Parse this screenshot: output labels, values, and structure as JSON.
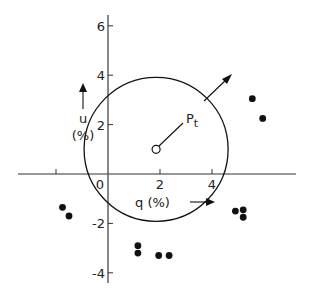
{
  "diagram": {
    "type": "scatter-with-circle",
    "center_label": "P_t",
    "center_label_main": "P",
    "center_label_sub": "t",
    "x_axis": {
      "label": "q (%)",
      "ticks": [
        {
          "value": 0,
          "label": "0"
        },
        {
          "value": 2,
          "label": "2"
        },
        {
          "value": 4,
          "label": "4"
        }
      ],
      "minor_ticks": [
        -2
      ]
    },
    "y_axis": {
      "label_top": "u",
      "label_bottom": "(%)",
      "ticks": [
        {
          "value": 6,
          "label": "6"
        },
        {
          "value": 4,
          "label": "4"
        },
        {
          "value": 2,
          "label": "2"
        },
        {
          "value": -2,
          "label": "-2"
        },
        {
          "value": -4,
          "label": "-4"
        }
      ]
    },
    "circle": {
      "center_q": 1.85,
      "center_u": 1.0,
      "radius": 4.0
    },
    "points": [
      {
        "q": -1.75,
        "u": -1.35
      },
      {
        "q": -1.5,
        "u": -1.7
      },
      {
        "q": 1.15,
        "u": -2.9
      },
      {
        "q": 1.15,
        "u": -3.2
      },
      {
        "q": 1.95,
        "u": -3.3
      },
      {
        "q": 2.35,
        "u": -3.3
      },
      {
        "q": 4.9,
        "u": -1.5
      },
      {
        "q": 5.2,
        "u": -1.45
      },
      {
        "q": 5.2,
        "u": -1.75
      },
      {
        "q": 5.55,
        "u": 3.05
      },
      {
        "q": 5.95,
        "u": 2.25
      }
    ]
  }
}
